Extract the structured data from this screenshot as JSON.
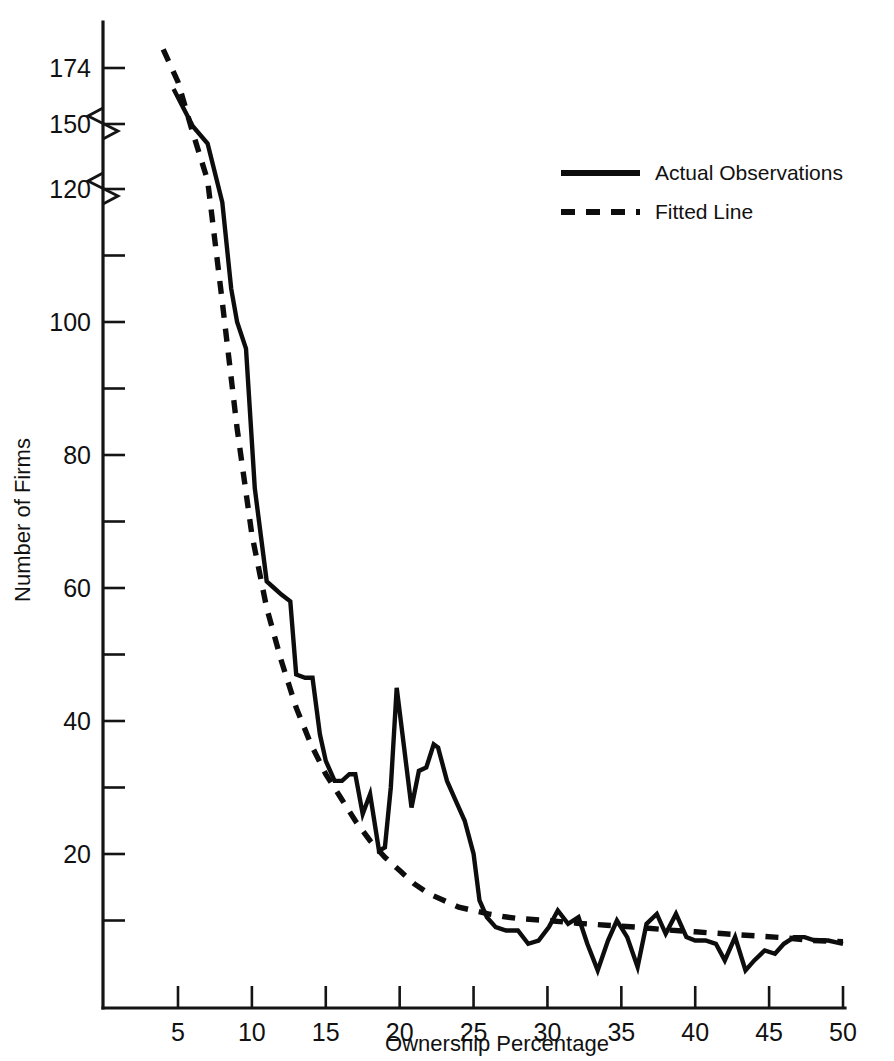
{
  "chart_data": {
    "type": "line",
    "title": "",
    "xlabel": "Ownership Percentage",
    "ylabel": "Number of Firms",
    "xlim": [
      3.0,
      50.0
    ],
    "ylim": [
      0,
      182
    ],
    "grid": false,
    "axis_break": {
      "present": true,
      "note": "Y axis is broken (compressed) between 120 and 150 and between 150 and 174",
      "segments": [
        {
          "from": 0,
          "to": 120
        },
        {
          "from": 120,
          "to": 150
        },
        {
          "from": 150,
          "to": 174
        }
      ]
    },
    "xticks": [
      5,
      10,
      15,
      20,
      25,
      30,
      35,
      40,
      45,
      50
    ],
    "xtick_labels": [
      "5",
      "10",
      "15",
      "20",
      "25",
      "30",
      "35",
      "40",
      "45",
      "50"
    ],
    "yticks": [
      20,
      40,
      60,
      80,
      100,
      120,
      150,
      174
    ],
    "ytick_labels": [
      "20",
      "40",
      "60",
      "80",
      "100",
      "120",
      "150",
      "174"
    ],
    "yticks_minor": [
      10,
      30,
      50,
      70,
      90,
      110
    ],
    "legend": {
      "position": "upper-right",
      "entries": [
        {
          "label": "Actual Observations",
          "style": "solid"
        },
        {
          "label": "Fitted Line",
          "style": "dashed"
        }
      ]
    },
    "series": [
      {
        "name": "Actual Observations",
        "style": "solid",
        "x": [
          4.7,
          6.0,
          7.0,
          8.0,
          8.6,
          9.0,
          9.6,
          10.2,
          11.0,
          11.5,
          12.0,
          12.6,
          13.0,
          13.6,
          14.1,
          14.6,
          15.0,
          15.6,
          16.1,
          16.6,
          17.0,
          17.5,
          18.0,
          18.6,
          19.0,
          19.4,
          19.8,
          20.3,
          20.8,
          21.3,
          21.8,
          22.3,
          22.6,
          23.2,
          23.8,
          24.4,
          25.0,
          25.4,
          25.9,
          26.5,
          27.2,
          28.0,
          28.7,
          29.4,
          30.1,
          30.7,
          31.4,
          32.1,
          32.7,
          33.4,
          34.1,
          34.7,
          35.4,
          36.1,
          36.7,
          37.4,
          38.0,
          38.7,
          39.4,
          40.0,
          40.7,
          41.4,
          42.0,
          42.7,
          43.4,
          44.0,
          44.7,
          45.4,
          46.0,
          46.7,
          47.4,
          48.1,
          49.0,
          50.0
        ],
        "y": [
          165,
          149,
          141,
          118,
          105,
          100,
          96,
          75,
          61,
          60,
          59,
          58,
          47,
          46.5,
          46.5,
          38,
          34,
          31,
          31,
          32,
          32,
          26,
          29,
          20.5,
          21,
          30,
          45,
          36,
          27,
          32.5,
          33,
          36.5,
          36,
          31,
          28,
          25,
          20,
          13,
          10.5,
          9,
          8.5,
          8.5,
          6.5,
          7,
          9,
          11.5,
          9.5,
          10.5,
          6.5,
          2.5,
          7,
          10,
          7.5,
          3,
          9.5,
          11,
          8,
          11,
          7.5,
          7,
          7,
          6.5,
          4,
          7.5,
          2.5,
          4,
          5.5,
          5,
          6.5,
          7.5,
          7.5,
          7,
          7,
          6.5
        ]
      },
      {
        "name": "Fitted Line",
        "style": "dashed",
        "x": [
          4.0,
          5.0,
          6.0,
          7.0,
          8.0,
          9.0,
          10.0,
          11.0,
          12.0,
          13.0,
          14.0,
          15.0,
          16.0,
          17.0,
          18.0,
          19.0,
          20.0,
          21.0,
          22.0,
          23.0,
          24.0,
          25.0,
          26.0,
          27.0,
          28.0,
          30.0,
          32.0,
          34.0,
          36.0,
          38.0,
          40.0,
          42.0,
          44.0,
          46.0,
          48.0,
          50.0
        ],
        "y": [
          182,
          168,
          146,
          124,
          103,
          84,
          68,
          57,
          49,
          42,
          36.5,
          32,
          28.5,
          25,
          22,
          19.5,
          17.5,
          15.5,
          14,
          13,
          12,
          11.5,
          11,
          10.6,
          10.3,
          10,
          9.6,
          9.3,
          9.0,
          8.6,
          8.3,
          8.0,
          7.7,
          7.4,
          7.0,
          6.8
        ]
      }
    ]
  }
}
